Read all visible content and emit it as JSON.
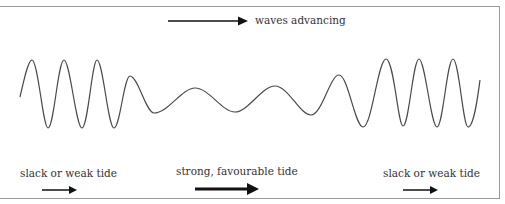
{
  "diagram": {
    "header": {
      "label": "waves advancing",
      "arrow_direction": "right"
    },
    "wave": {
      "color": "#4a4a4a",
      "points": [
        [
          20,
          97
        ],
        [
          32,
          60
        ],
        [
          48,
          128
        ],
        [
          64,
          60
        ],
        [
          82,
          128
        ],
        [
          97,
          60
        ],
        [
          114,
          128
        ],
        [
          130,
          76
        ],
        [
          154,
          113
        ],
        [
          195,
          88
        ],
        [
          235,
          112
        ],
        [
          275,
          86
        ],
        [
          311,
          115
        ],
        [
          339,
          75
        ],
        [
          363,
          127
        ],
        [
          386,
          59
        ],
        [
          403,
          126
        ],
        [
          419,
          59
        ],
        [
          437,
          127
        ],
        [
          453,
          59
        ],
        [
          468,
          127
        ],
        [
          480,
          80
        ]
      ]
    },
    "zones": [
      {
        "label": "slack or weak tide",
        "arrow": "short-thin"
      },
      {
        "label": "strong, favourable tide",
        "arrow": "long-thick"
      },
      {
        "label": "slack or weak tide",
        "arrow": "short-thin"
      }
    ]
  }
}
